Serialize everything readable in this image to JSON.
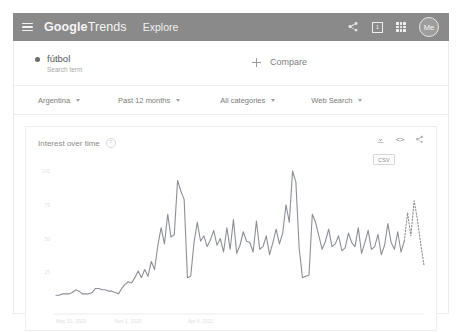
{
  "appbar": {
    "menu_icon": "hamburger-menu-icon",
    "brand_strong": "Google",
    "brand_light": "Trends",
    "explore_label": "Explore",
    "share_icon": "share-icon",
    "notifications_badge": "1",
    "apps_icon": "apps-grid-icon",
    "avatar_label": "Me",
    "bg_color": "#8a8a8a"
  },
  "query": {
    "term": "fútbol",
    "term_type": "Search term",
    "compare_label": "Compare"
  },
  "filters": [
    {
      "label": "Argentina"
    },
    {
      "label": "Past 12 months"
    },
    {
      "label": "All categories"
    },
    {
      "label": "Web Search"
    }
  ],
  "chart_card": {
    "title": "Interest over time",
    "help_icon": "help-circle-icon",
    "download_icon": "download-icon",
    "embed_icon": "<>",
    "share_icon": "share-icon",
    "csv_label": "CSV"
  },
  "chart_data": {
    "type": "line",
    "title": "Interest over time",
    "xlabel": "",
    "ylabel": "",
    "ylim": [
      0,
      100
    ],
    "yticks": [
      "100",
      "75",
      "50",
      "25"
    ],
    "ytick_values": [
      100,
      75,
      50,
      25
    ],
    "grid": false,
    "legend": "none",
    "series_color": "#8c8f96",
    "xticks": [
      "May 31, 2020",
      "Nov 1, 2020",
      "Apr 4, 2021"
    ],
    "xtick_index": [
      0,
      22,
      44
    ],
    "partial_data_from_index": 44,
    "series": [
      {
        "name": "fútbol",
        "values": [
          8,
          8,
          9,
          9,
          9,
          10,
          12,
          11,
          9,
          9,
          9,
          10,
          13,
          13,
          12,
          12,
          11,
          11,
          10,
          9,
          13,
          16,
          18,
          17,
          21,
          26,
          21,
          27,
          22,
          33,
          27,
          45,
          58,
          46,
          68,
          51,
          53,
          93,
          85,
          79,
          21,
          22,
          47,
          62,
          48,
          52,
          44,
          49,
          56,
          45,
          50,
          40,
          58,
          42,
          64,
          39,
          45,
          55,
          48,
          47,
          40,
          63,
          42,
          44,
          52,
          38,
          47,
          57,
          46,
          54,
          75,
          62,
          100,
          92,
          43,
          21,
          22,
          23,
          68,
          62,
          52,
          42,
          48,
          57,
          44,
          46,
          52,
          41,
          43,
          54,
          47,
          44,
          58,
          39,
          47,
          56,
          42,
          44,
          53,
          38,
          45,
          61,
          47,
          42,
          55,
          40,
          48,
          69,
          52,
          78,
          64,
          46,
          30
        ]
      }
    ]
  }
}
